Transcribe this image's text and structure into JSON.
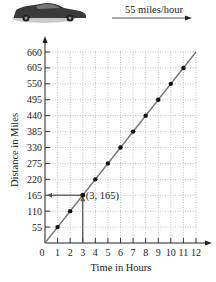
{
  "header": {
    "car_icon": "car-icon",
    "speed_label": "55 miles/hour"
  },
  "chart_data": {
    "type": "line",
    "title": "",
    "xlabel": "Time in Hours",
    "ylabel": "Distance in Miles",
    "x": [
      1,
      2,
      3,
      4,
      5,
      6,
      7,
      8,
      9,
      10,
      11
    ],
    "series": [
      {
        "name": "Distance at 55 miles/hour",
        "values": [
          55,
          110,
          165,
          220,
          275,
          330,
          385,
          440,
          495,
          550,
          605
        ]
      }
    ],
    "xticks": [
      "0",
      "1",
      "2",
      "3",
      "4",
      "5",
      "6",
      "7",
      "8",
      "9",
      "10",
      "11",
      "12"
    ],
    "yticks": [
      "55",
      "110",
      "165",
      "220",
      "275",
      "330",
      "385",
      "440",
      "495",
      "550",
      "605",
      "660"
    ],
    "xlim": [
      0,
      12
    ],
    "ylim": [
      0,
      660
    ],
    "grid": true,
    "annotation": {
      "label": "(3, 165)",
      "x": 3,
      "y": 165
    }
  }
}
